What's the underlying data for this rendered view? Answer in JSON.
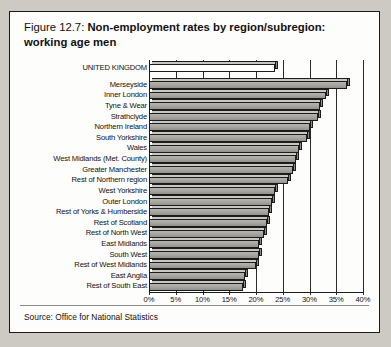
{
  "figure": {
    "number_label": "Figure 12.7:",
    "title": "Non-employment rates by region/subregion:",
    "title_line2": "working age men",
    "source": "Source: Office for National Statistics"
  },
  "chart_data": {
    "type": "bar",
    "orientation": "horizontal",
    "title": "Non-employment rates by region/subregion: working age men",
    "xlabel": "",
    "ylabel": "",
    "xlim": [
      0,
      40
    ],
    "grid": true,
    "legend": "none",
    "tick_labels": [
      "0%",
      "5%",
      "10%",
      "15%",
      "20%",
      "25%",
      "30%",
      "35%",
      "40%"
    ],
    "tick_values": [
      0,
      5,
      10,
      15,
      20,
      25,
      30,
      35,
      40
    ],
    "categories": [
      "UNITED KINGDOM",
      "Merseyside",
      "Inner London",
      "Tyne & Wear",
      "Strathclyde",
      "Northern Ireland",
      "South Yorkshire",
      "Wales",
      "West Midlands (Met. County)",
      "Greater Manchester",
      "Rest of Northern region",
      "West Yorkshire",
      "Outer London",
      "Rest of Yorks & Humberside",
      "Rest of Scotland",
      "Rest of North West",
      "East Midlands",
      "South West",
      "Rest of West Midlands",
      "East Anglia",
      "Rest of South East"
    ],
    "values": [
      23.5,
      37.0,
      33.0,
      32.0,
      31.5,
      30.0,
      29.5,
      28.0,
      27.5,
      27.0,
      26.0,
      23.5,
      23.0,
      22.5,
      22.0,
      21.5,
      20.5,
      20.5,
      20.0,
      18.0,
      17.5
    ],
    "highlight_category": "UNITED KINGDOM",
    "colors": {
      "bar_fill": "#a9a7a1",
      "highlight_fill": "#ffffff",
      "bar_outline": "#1c1c1c",
      "grid": "#2b2b2b",
      "background": "#fdfdfb"
    }
  }
}
